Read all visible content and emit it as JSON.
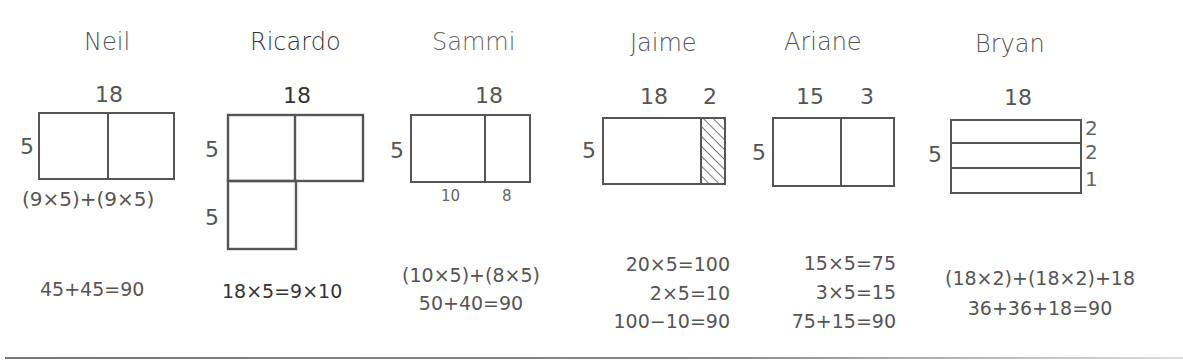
{
  "strategies": [
    {
      "name": "Neil",
      "top_labels": [
        "18"
      ],
      "side_labels": [
        "5"
      ],
      "below_label": "(9×5)+(9×5)",
      "equations": [
        "45+45=90"
      ]
    },
    {
      "name": "Ricardo",
      "top_labels": [
        "18"
      ],
      "side_labels": [
        "5",
        "5"
      ],
      "equations": [
        "18×5=9×10"
      ]
    },
    {
      "name": "Sammi",
      "top_labels": [
        "18"
      ],
      "side_labels": [
        "5"
      ],
      "bottom_labels": [
        "10",
        "8"
      ],
      "equations": [
        "(10×5)+(8×5)",
        "50+40=90"
      ]
    },
    {
      "name": "Jaime",
      "top_labels": [
        "18",
        "2"
      ],
      "side_labels": [
        "5"
      ],
      "equations": [
        "20×5=100",
        "2×5=10",
        "100−10=90"
      ]
    },
    {
      "name": "Ariane",
      "top_labels": [
        "15",
        "3"
      ],
      "side_labels": [
        "5"
      ],
      "equations": [
        "15×5=75",
        "3×5=15",
        "75+15=90"
      ]
    },
    {
      "name": "Bryan",
      "top_labels": [
        "18"
      ],
      "side_labels": [
        "5"
      ],
      "right_labels": [
        "2",
        "2",
        "1"
      ],
      "equations": [
        "(18×2)+(18×2)+18",
        "36+36+18=90"
      ]
    }
  ],
  "colors": {
    "stroke": "#555555",
    "text": "#555555",
    "background": "#ffffff"
  }
}
